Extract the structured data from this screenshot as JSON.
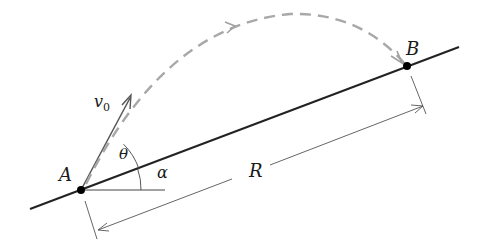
{
  "diagram": {
    "labels": {
      "point_a": "A",
      "point_b": "B",
      "initial_velocity": "v",
      "initial_velocity_sub": "0",
      "launch_angle": "θ",
      "incline_angle": "α",
      "range": "R"
    },
    "colors": {
      "line": "#222222",
      "trajectory": "#a6a6a6",
      "dimension": "#555555",
      "shading": "#9a9a9a",
      "point": "#000000"
    }
  }
}
